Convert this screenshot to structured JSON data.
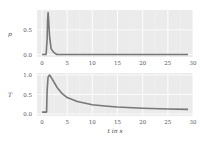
{
  "chart_data": [
    {
      "type": "line",
      "title": "",
      "xlabel": "",
      "ylabel": "p",
      "xlim": [
        -1,
        30
      ],
      "ylim": [
        -0.05,
        0.9
      ],
      "xticks": [
        "0",
        "5",
        "10",
        "15",
        "20",
        "25",
        "30"
      ],
      "yticks": [
        "0.0",
        "0.5"
      ],
      "grid": true,
      "series": [
        {
          "name": "p",
          "color": "#777777",
          "x": [
            0,
            0.8,
            1.0,
            1.1,
            1.2,
            1.3,
            1.5,
            1.8,
            2.2,
            2.6,
            3.0,
            5,
            10,
            15,
            20,
            25,
            29
          ],
          "y": [
            0,
            0,
            0.3,
            0.7,
            0.85,
            0.7,
            0.35,
            0.12,
            0.06,
            0.02,
            0,
            0,
            0,
            0,
            0,
            0,
            0
          ]
        }
      ]
    },
    {
      "type": "line",
      "title": "",
      "xlabel": "t in s",
      "ylabel": "T",
      "xlim": [
        -1,
        30
      ],
      "ylim": [
        -0.05,
        1.05
      ],
      "xticks": [
        "0",
        "5",
        "10",
        "15",
        "20",
        "25",
        "30"
      ],
      "yticks": [
        "0.0",
        "0.5",
        "1.0"
      ],
      "grid": true,
      "series": [
        {
          "name": "T",
          "color": "#777777",
          "x": [
            0,
            0.9,
            1.0,
            1.2,
            1.5,
            2,
            3,
            4,
            5,
            7,
            10,
            13,
            15,
            20,
            25,
            29
          ],
          "y": [
            0.05,
            0.05,
            0.6,
            0.95,
            1.0,
            0.9,
            0.68,
            0.52,
            0.42,
            0.32,
            0.24,
            0.2,
            0.18,
            0.15,
            0.13,
            0.12
          ]
        }
      ]
    }
  ]
}
